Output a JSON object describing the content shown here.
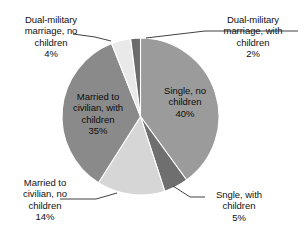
{
  "chart_data": {
    "type": "pie",
    "title": "",
    "subtitle": "",
    "xlabel": "",
    "ylabel": "",
    "legend_position": "none",
    "grid": false,
    "value_unit": "%",
    "start_angle_deg": 0,
    "direction": "clockwise",
    "categories": [
      "Single, no children",
      "Sngle, with children",
      "Married to civilian, no children",
      "Married to civilian, with children",
      "Dual-military marriage, no children",
      "Dual-military marriage, with children"
    ],
    "values": [
      40,
      5,
      14,
      35,
      4,
      2
    ],
    "colors": [
      "#9b9b9b",
      "#6f6f6f",
      "#d6d6d6",
      "#8a8a8a",
      "#e9e9e9",
      "#6b6b6b"
    ],
    "slices": [
      {
        "name": "single-no-children",
        "label": "Single, no\nchildren",
        "value_label": "40%",
        "value": 40,
        "color": "#9b9b9b",
        "label_placement": "inside"
      },
      {
        "name": "single-with-children",
        "label": "Sngle, with\nchildren",
        "value_label": "5%",
        "value": 5,
        "color": "#6f6f6f",
        "label_placement": "callout"
      },
      {
        "name": "civilian-no-children",
        "label": "Married to\ncivilian, no\nchildren",
        "value_label": "14%",
        "value": 14,
        "color": "#d6d6d6",
        "label_placement": "callout"
      },
      {
        "name": "civilian-with-children",
        "label": "Married to\ncivilian, with\nchildren",
        "value_label": "35%",
        "value": 35,
        "color": "#8a8a8a",
        "label_placement": "inside"
      },
      {
        "name": "dual-military-no-children",
        "label": "Dual-military\nmarriage, no\nchildren",
        "value_label": "4%",
        "value": 4,
        "color": "#e9e9e9",
        "label_placement": "callout"
      },
      {
        "name": "dual-military-with-children",
        "label": "Dual-military\nmarriage, with\nchildren",
        "value_label": "2%",
        "value": 2,
        "color": "#6b6b6b",
        "label_placement": "callout"
      }
    ]
  },
  "labels": {
    "single_no_children": "Single, no\nchildren\n40%",
    "single_with_children": "Sngle, with\nchildren\n5%",
    "civilian_no_children": "Married to\ncivilian, no\nchildren\n14%",
    "civilian_with_children": "Married to\ncivilian, with\nchildren\n35%",
    "dual_no_children": "Dual-military\nmarriage, no\nchildren\n4%",
    "dual_with_children": "Dual-military\nmarriage, with\nchildren\n2%"
  },
  "geometry": {
    "center_x": 140.5,
    "center_y": 116.5,
    "radius": 78.5
  },
  "style": {
    "background": "#ffffff",
    "leader_line_color": "#2b2b2b",
    "slice_edge_color": "#ffffff"
  }
}
